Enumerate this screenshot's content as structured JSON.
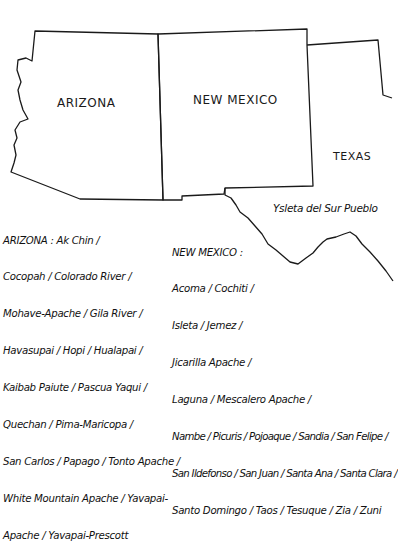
{
  "map": {
    "states": [
      {
        "name": "ARIZONA"
      },
      {
        "name": "NEW MEXICO"
      },
      {
        "name": "TEXAS"
      }
    ],
    "annotations": {
      "ysleta": "Ysleta del Sur Pueblo"
    },
    "arizona_list": {
      "lines": [
        "ARIZONA : Ak Chin /",
        "Cocopah / Colorado River /",
        "Mohave-Apache / Gila River /",
        "Havasupai / Hopi / Hualapai /",
        "Kaibab Paiute / Pascua Yaqui /",
        "Quechan / Pima-Maricopa /",
        "San Carlos / Papago / Tonto Apache /",
        "White Mountain Apache / Yavapai-",
        "Apache / Yavapai-Prescott"
      ]
    },
    "new_mexico_list": {
      "lines": [
        "NEW MEXICO :",
        "Acoma / Cochiti /",
        "Isleta / Jemez /",
        "Jicarilla Apache /",
        "Laguna / Mescalero Apache /",
        "Nambe / Picuris / Pojoaque / Sandia / San Felipe /",
        "San Ildefonso / San Juan / Santa Ana / Santa Clara /",
        "Santo Domingo / Taos / Tesuque / Zia / Zuni"
      ]
    },
    "colors": {
      "ink": "#111111",
      "background": "#ffffff"
    }
  }
}
